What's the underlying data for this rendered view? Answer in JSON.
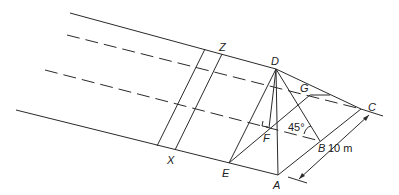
{
  "diagram": {
    "points": {
      "A": {
        "label": "A",
        "x": 278,
        "y": 175
      },
      "B": {
        "label": "B",
        "x": 320,
        "y": 141
      },
      "C": {
        "label": "C",
        "x": 361,
        "y": 109
      },
      "D": {
        "label": "D",
        "x": 276,
        "y": 69
      },
      "E": {
        "label": "E",
        "x": 229,
        "y": 163
      },
      "F": {
        "label": "F",
        "x": 269,
        "y": 128
      },
      "G": {
        "label": "G",
        "x": 310,
        "y": 95
      },
      "X": {
        "label": "X",
        "x": 175,
        "y": 150
      },
      "Z": {
        "label": "Z",
        "x": 222,
        "y": 54
      }
    },
    "angle_label": "45°",
    "dimension_label": "10 m",
    "colors": {
      "line": "#2a2a2a",
      "background": "#ffffff"
    }
  }
}
